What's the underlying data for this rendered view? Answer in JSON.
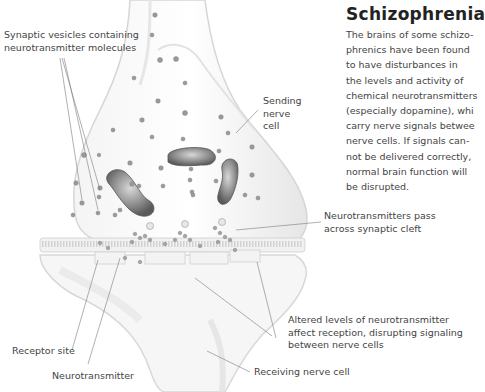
{
  "title": "Schizophrenia",
  "body_lines": [
    "The brains of some schizo-",
    "phrenics have been found",
    "to have disturbances in",
    "the levels and activity of",
    "chemical neurotransmitters",
    "(especially dopamine), whi",
    "carry nerve signals betwee",
    "nerve cells. If signals can-",
    "not be delivered correctly,",
    "normal brain function will",
    "be disrupted."
  ],
  "labels": {
    "vesicles": [
      "Synaptic vesicles containing",
      "neurotransmitter molecules"
    ],
    "sending": [
      "Sending",
      "nerve",
      "cell"
    ],
    "cleft": [
      "Neurotransmitters pass",
      "across synaptic cleft"
    ],
    "altered": [
      "Altered levels of neurotransmitter",
      "affect reception, disrupting signaling",
      "between nerve cells"
    ],
    "receptor": "Receptor site",
    "neurotransmitter": "Neurotransmitter",
    "receiving": "Receiving nerve cell"
  },
  "colors": {
    "background": "#ffffff",
    "membrane": "#e9e9e9",
    "mitochondria": "#8a8a8a",
    "text": "#444444",
    "title": "#222222"
  }
}
